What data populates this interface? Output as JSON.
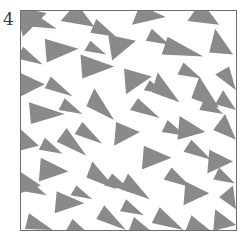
{
  "figure": {
    "panel_label": "4",
    "background_color": "#ffffff",
    "frame_color": "#6e6e6e",
    "triangle_fill": "#8a8a8a",
    "label_color": "#3a3a3a"
  },
  "chart_data": {
    "type": "scatter",
    "title": "4",
    "subtitle": "",
    "xlabel": "",
    "ylabel": "",
    "xlim": [
      0,
      217
    ],
    "ylim": [
      0,
      221
    ],
    "grid": false,
    "legend": null,
    "tick_labels_x": [],
    "tick_labels_y": [],
    "marker": "triangle",
    "marker_color": "#8a8a8a",
    "n_markers": 59,
    "markers": [
      {
        "id": 1,
        "points": "-6,-4 26,2 2,26"
      },
      {
        "id": 2,
        "points": "56,-8 74,16 40,10"
      },
      {
        "id": 3,
        "points": "120,-6 146,6 112,14"
      },
      {
        "id": 4,
        "points": "182,-10 200,14 168,10"
      },
      {
        "id": 5,
        "points": "24,28 58,38 26,52"
      },
      {
        "id": 6,
        "points": "88,24 116,30 92,50"
      },
      {
        "id": 7,
        "points": "60,44 94,56 62,68"
      },
      {
        "id": 8,
        "points": "148,26 184,46 142,44"
      },
      {
        "id": 9,
        "points": "196,18 214,44 190,42"
      },
      {
        "id": 10,
        "points": "210,56 217,80 196,64"
      },
      {
        "id": 11,
        "points": "-2,62 24,74 -4,88"
      },
      {
        "id": 12,
        "points": "104,58 132,66 106,84"
      },
      {
        "id": 13,
        "points": "8,92 44,104 10,114"
      },
      {
        "id": 14,
        "points": "74,78 94,110 66,96"
      },
      {
        "id": 15,
        "points": "138,62 160,92 132,82"
      },
      {
        "id": 16,
        "points": "180,66 200,98 172,88"
      },
      {
        "id": 17,
        "points": "46,118 66,146 36,132"
      },
      {
        "id": 18,
        "points": "96,112 120,122 94,136"
      },
      {
        "id": 19,
        "points": "160,106 186,122 158,130"
      },
      {
        "id": 20,
        "points": "206,104 217,130 194,120"
      },
      {
        "id": 21,
        "points": "-4,116 18,136 -6,142"
      },
      {
        "id": 22,
        "points": "124,136 152,148 122,160"
      },
      {
        "id": 23,
        "points": "190,140 214,152 188,164"
      },
      {
        "id": 24,
        "points": "20,148 48,162 18,172"
      },
      {
        "id": 25,
        "points": "72,152 96,180 66,168"
      },
      {
        "id": 26,
        "points": "-4,160 20,176 -6,186"
      },
      {
        "id": 27,
        "points": "108,164 130,190 100,180"
      },
      {
        "id": 28,
        "points": "166,172 190,184 164,196"
      },
      {
        "id": 29,
        "points": "36,182 64,194 34,204"
      },
      {
        "id": 30,
        "points": "84,196 106,221 76,210"
      },
      {
        "id": 31,
        "points": "140,198 164,221 132,214"
      },
      {
        "id": 32,
        "points": "196,200 217,216 194,222"
      },
      {
        "id": 33,
        "points": "8,204 32,221 4,220"
      },
      {
        "id": 34,
        "points": "52,210 72,228 44,224"
      },
      {
        "id": 35,
        "points": "114,208 136,226 108,224"
      },
      {
        "id": 36,
        "points": "172,206 194,224 166,222"
      },
      {
        "id": 37,
        "points": "214,176 217,200 200,188"
      },
      {
        "id": 38,
        "points": "30,66 52,86 24,78"
      },
      {
        "id": 39,
        "points": "152,158 172,178 144,170"
      },
      {
        "id": 40,
        "points": "62,112 82,134 54,124"
      },
      {
        "id": 41,
        "points": "118,88 140,108 110,100"
      },
      {
        "id": 42,
        "points": "2,36 22,54 -4,48"
      },
      {
        "id": 43,
        "points": "172,130 192,150 164,142"
      },
      {
        "id": 44,
        "points": "92,164 112,182 84,176"
      },
      {
        "id": 45,
        "points": "44,88 62,104 38,100"
      },
      {
        "id": 46,
        "points": "204,80 217,100 196,94"
      },
      {
        "id": 47,
        "points": "76,8 96,26 70,22"
      },
      {
        "id": 48,
        "points": "132,18 150,34 126,30"
      },
      {
        "id": 49,
        "points": "16,4 36,18 12,16"
      },
      {
        "id": 50,
        "points": "106,190 124,206 100,202"
      },
      {
        "id": 51,
        "points": "186,86 204,104 180,100"
      },
      {
        "id": 52,
        "points": "148,110 166,126 142,122"
      },
      {
        "id": 53,
        "points": "24,128 42,144 18,140"
      },
      {
        "id": 54,
        "points": "70,30 86,44 64,40"
      },
      {
        "id": 55,
        "points": "164,52 182,68 158,64"
      },
      {
        "id": 56,
        "points": "8,170 26,186 2,182"
      },
      {
        "id": 57,
        "points": "130,70 146,84 124,80"
      },
      {
        "id": 58,
        "points": "200,158 216,174 194,170"
      },
      {
        "id": 59,
        "points": "56,176 72,190 50,186"
      }
    ]
  }
}
